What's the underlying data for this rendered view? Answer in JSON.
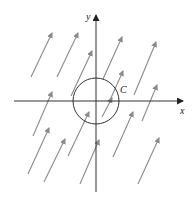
{
  "diagram": {
    "labels": {
      "x_axis": "x",
      "y_axis": "y",
      "curve": "C"
    },
    "colors": {
      "axis": "#333333",
      "arrow": "#8a8a8a",
      "curve": "#333333"
    },
    "axes": {
      "x": {
        "x1": 14,
        "y1": 101,
        "x2": 183,
        "y2": 101
      },
      "y": {
        "x1": 96,
        "y1": 192,
        "x2": 96,
        "y2": 15
      }
    },
    "curve": {
      "shape": "circle",
      "cx": 96,
      "cy": 101,
      "r": 23
    },
    "arrows": [
      {
        "x1": 31,
        "y1": 77,
        "x2": 52,
        "y2": 33
      },
      {
        "x1": 57,
        "y1": 77,
        "x2": 78,
        "y2": 33
      },
      {
        "x1": 71,
        "y1": 96,
        "x2": 92,
        "y2": 51
      },
      {
        "x1": 103,
        "y1": 79,
        "x2": 122,
        "y2": 37
      },
      {
        "x1": 134,
        "y1": 95,
        "x2": 156,
        "y2": 42
      },
      {
        "x1": 110,
        "y1": 100,
        "x2": 123,
        "y2": 71
      },
      {
        "x1": 142,
        "y1": 121,
        "x2": 157,
        "y2": 85
      },
      {
        "x1": 33,
        "y1": 136,
        "x2": 52,
        "y2": 92
      },
      {
        "x1": 28,
        "y1": 174,
        "x2": 49,
        "y2": 128
      },
      {
        "x1": 44,
        "y1": 182,
        "x2": 65,
        "y2": 139
      },
      {
        "x1": 68,
        "y1": 156,
        "x2": 89,
        "y2": 112
      },
      {
        "x1": 80,
        "y1": 184,
        "x2": 99,
        "y2": 140
      },
      {
        "x1": 113,
        "y1": 157,
        "x2": 133,
        "y2": 112
      },
      {
        "x1": 138,
        "y1": 184,
        "x2": 159,
        "y2": 138
      },
      {
        "x1": 102,
        "y1": 117,
        "x2": 112,
        "y2": 98
      }
    ]
  }
}
